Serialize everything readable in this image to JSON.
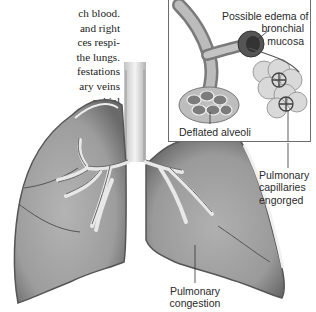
{
  "body_text": {
    "lines": [
      "ch blood.",
      "and right",
      "ces respi-",
      "the lungs.",
      "festations",
      "ary veins",
      "nchial"
    ]
  },
  "figure": {
    "main_subject": "lungs-illustration",
    "labels": {
      "edema": [
        "Possible edema of",
        "bronchial",
        "mucosa"
      ],
      "alveoli": "Deflated alveoli",
      "capillaries": [
        "Pulmonary",
        "capillaries",
        "engorged"
      ],
      "congestion": [
        "Pulmonary",
        "congestion"
      ]
    }
  }
}
